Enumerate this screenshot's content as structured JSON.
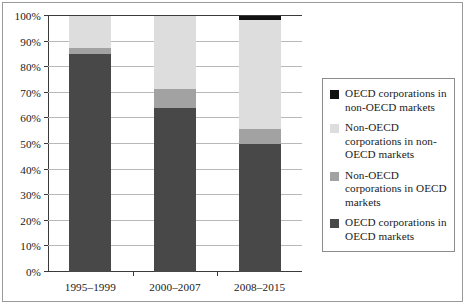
{
  "chart_data": {
    "type": "bar",
    "title": "",
    "subtitle": "",
    "xlabel": "",
    "ylabel": "",
    "stacked": true,
    "stack_mode": "percent",
    "grid": true,
    "grid_axis": "y",
    "legend_position": "right",
    "ylim": [
      0,
      100
    ],
    "ytick_labels": [
      "0%",
      "10%",
      "20%",
      "30%",
      "40%",
      "50%",
      "60%",
      "70%",
      "80%",
      "90%",
      "100%"
    ],
    "ytick_values": [
      0,
      10,
      20,
      30,
      40,
      50,
      60,
      70,
      80,
      90,
      100
    ],
    "categories": [
      "1995–1999",
      "2000–2007",
      "2008–2015"
    ],
    "series": [
      {
        "name": "OECD corporations in OECD markets",
        "color": "#484848",
        "values": [
          85.0,
          64.0,
          50.0
        ]
      },
      {
        "name": "Non-OECD corporations in OECD markets",
        "color": "#a2a2a2",
        "values": [
          2.5,
          7.5,
          6.0
        ]
      },
      {
        "name": "Non-OECD corporations in non-OECD markets",
        "color": "#dddddd",
        "values": [
          12.5,
          28.5,
          42.5
        ]
      },
      {
        "name": "OECD corporations in non-OECD markets",
        "color": "#111111",
        "values": [
          0.0,
          0.0,
          1.5
        ]
      }
    ]
  },
  "legend": {
    "entries": [
      {
        "label": "OECD corporations in non-OECD markets",
        "color": "#111111"
      },
      {
        "label": "Non-OECD corporations in non-OECD markets",
        "color": "#dddddd"
      },
      {
        "label": "Non-OECD corporations in OECD markets",
        "color": "#a2a2a2"
      },
      {
        "label": "OECD corporations in OECD markets",
        "color": "#484848"
      }
    ]
  }
}
